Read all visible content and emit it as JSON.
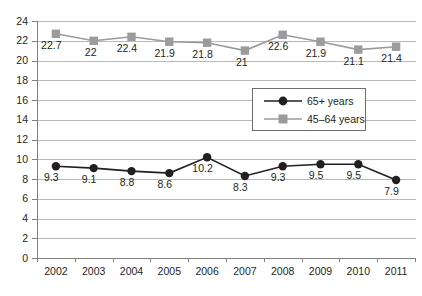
{
  "chart_data": {
    "type": "line",
    "title": "",
    "xlabel": "",
    "ylabel": "",
    "ylim": [
      0,
      24
    ],
    "ytick_step": 2,
    "grid": true,
    "legend_position": "center-right",
    "categories": [
      "2002",
      "2003",
      "2004",
      "2005",
      "2006",
      "2007",
      "2008",
      "2009",
      "2010",
      "2011"
    ],
    "ytick_labels": [
      "0",
      "2",
      "4",
      "6",
      "8",
      "10",
      "12",
      "14",
      "16",
      "18",
      "20",
      "22",
      "24"
    ],
    "series": [
      {
        "name": "65+ years",
        "marker": "circle",
        "color": "#231f20",
        "values": [
          9.3,
          9.1,
          8.8,
          8.6,
          10.2,
          8.3,
          9.3,
          9.5,
          9.5,
          7.9
        ],
        "labels": [
          "9.3",
          "9.1",
          "8.8",
          "8.6",
          "10.2",
          "8.3",
          "9.3",
          "9.5",
          "9.5",
          "7.9"
        ]
      },
      {
        "name": "45–64 years",
        "marker": "square",
        "color": "#9b9b9b",
        "values": [
          22.7,
          22.0,
          22.4,
          21.9,
          21.8,
          21.0,
          22.6,
          21.9,
          21.1,
          21.4
        ],
        "labels": [
          "22.7",
          "22",
          "22.4",
          "21.9",
          "21.8",
          "21",
          "22.6",
          "21.9",
          "21.1",
          "21.4"
        ]
      }
    ]
  },
  "legend": {
    "items": [
      {
        "label": "65+ years"
      },
      {
        "label": "45–64 years"
      }
    ]
  }
}
